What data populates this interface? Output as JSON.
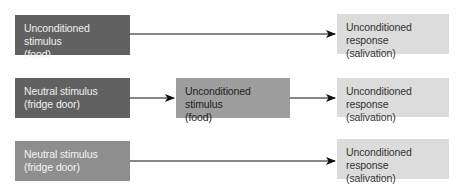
{
  "rows": [
    {
      "boxes": [
        {
          "line1": "Unconditioned stimulus",
          "line2": "(food)"
        },
        {
          "line1": "Unconditioned response",
          "line2": "(salivation)"
        }
      ]
    },
    {
      "boxes": [
        {
          "line1": "Neutral stimulus",
          "line2": "(fridge door)"
        },
        {
          "line1": "Unconditioned stimulus",
          "line2": "(food)"
        },
        {
          "line1": "Unconditioned response",
          "line2": "(salivation)"
        }
      ]
    },
    {
      "boxes": [
        {
          "line1": "Neutral stimulus",
          "line2": "(fridge door)"
        },
        {
          "line1": "Unconditioned response",
          "line2": "(salivation)"
        }
      ]
    }
  ],
  "colors": {
    "dark": "#616161",
    "medium": "#8e8e8e",
    "midgray": "#9e9e9e",
    "light": "#dcdcdc",
    "arrow": "#111111"
  }
}
